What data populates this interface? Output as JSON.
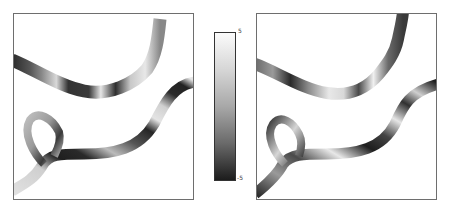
{
  "figure": {
    "panels": [
      {
        "id": "left",
        "description": "vessel field map (before)"
      },
      {
        "id": "right",
        "description": "vessel field map (after)"
      }
    ],
    "colorbar": {
      "max_label": "5",
      "min_label": "-5",
      "colormap": "grayscale",
      "top_color": "#fbfbfb",
      "bottom_color": "#1c1c1c"
    }
  }
}
